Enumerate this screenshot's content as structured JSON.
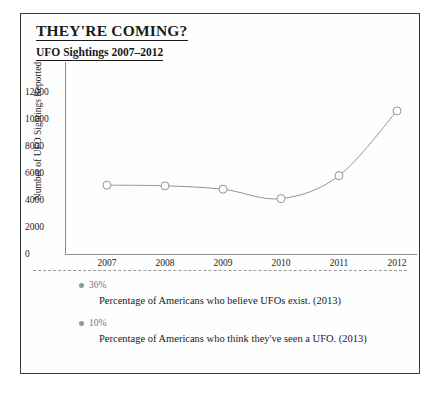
{
  "card": {
    "title": "THEY'RE COMING?",
    "subtitle": "UFO Sightings 2007–2012"
  },
  "chart_data": {
    "type": "line",
    "title": "UFO Sightings 2007–2012",
    "xlabel": "",
    "ylabel": "Number of UFO Sightings Reported",
    "categories": [
      "2007",
      "2008",
      "2009",
      "2010",
      "2011",
      "2012"
    ],
    "values": [
      5100,
      5050,
      4800,
      4100,
      5800,
      10600
    ],
    "ylim": [
      0,
      12000
    ],
    "ytick_labels": [
      "12000",
      "10000",
      "8000",
      "6000",
      "4000",
      "2000",
      "0"
    ],
    "ytick_values": [
      12000,
      10000,
      8000,
      6000,
      4000,
      2000,
      0
    ],
    "grid": false,
    "legend": "none",
    "marker": "open-circle",
    "line_color": "#8d96a3",
    "marker_color": "#8d96a3"
  },
  "stats": [
    {
      "value": "36%",
      "description": "Percentage of Americans who believe UFOs exist. (2013)"
    },
    {
      "value": "10%",
      "description": "Percentage of Americans who think they've seen a UFO. (2013)"
    }
  ]
}
